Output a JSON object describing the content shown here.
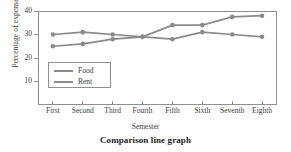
{
  "caption": "Comparison line graph",
  "axes": {
    "y_title": "Percentage of expenses",
    "x_title": "Semester",
    "y_ticks": [
      "40",
      "30",
      "20",
      "10"
    ],
    "x_ticks": [
      "First",
      "Second",
      "Third",
      "Fourth",
      "Fifth",
      "Sixth",
      "Seventh",
      "Eighth"
    ]
  },
  "legend": {
    "entries": [
      {
        "label": "Food",
        "color": "#8a8a8a"
      },
      {
        "label": "Rent",
        "color": "#8a8a8a"
      }
    ]
  },
  "colors": {
    "food": "#8a8a8a",
    "rent": "#8a8a8a",
    "axis": "#8f8f8f",
    "text": "#3a3a3a",
    "caption": "#1d1d1d",
    "background": "#ffffff"
  },
  "chart_data": {
    "type": "line",
    "title": "Comparison line graph",
    "xlabel": "Semester",
    "ylabel": "Percentage of expenses",
    "categories": [
      "First",
      "Second",
      "Third",
      "Fourth",
      "Fifth",
      "Sixth",
      "Seventh",
      "Eighth"
    ],
    "series": [
      {
        "name": "Food",
        "color": "#8a8a8a",
        "values": [
          25,
          26,
          28,
          29,
          34,
          34,
          37.5,
          38
        ]
      },
      {
        "name": "Rent",
        "color": "#8a8a8a",
        "values": [
          30,
          31,
          30,
          29,
          28,
          31,
          30,
          29
        ]
      }
    ],
    "ylim": [
      0,
      40
    ],
    "yticks": [
      10,
      20,
      30,
      40
    ],
    "grid": false,
    "legend_position": "inside-lower-left",
    "markers": "filled-circle"
  }
}
